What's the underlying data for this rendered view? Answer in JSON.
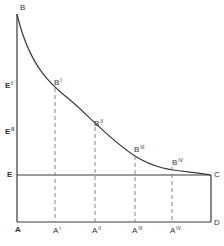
{
  "diagram": {
    "type": "geometric-curve-diagram",
    "colors": {
      "line": "#3a3a3a",
      "dashed": "#777777",
      "text": "#333333",
      "background": "#ffffff"
    },
    "points": {
      "B": {
        "label": "B",
        "sup": ""
      },
      "B1": {
        "label": "B",
        "sup": "I"
      },
      "B2": {
        "label": "B",
        "sup": "II"
      },
      "B3": {
        "label": "B",
        "sup": "III"
      },
      "B4": {
        "label": "B",
        "sup": "IV"
      },
      "A": {
        "label": "A",
        "sup": ""
      },
      "A1": {
        "label": "A",
        "sup": "I"
      },
      "A2": {
        "label": "A",
        "sup": "II"
      },
      "A3": {
        "label": "A",
        "sup": "III"
      },
      "A4": {
        "label": "A",
        "sup": "IV"
      },
      "E": {
        "label": "E",
        "sup": ""
      },
      "E1": {
        "label": "E",
        "sup": "I"
      },
      "E2": {
        "label": "E",
        "sup": "II"
      },
      "C": {
        "label": "C",
        "sup": ""
      },
      "D": {
        "label": "D",
        "sup": ""
      }
    }
  }
}
